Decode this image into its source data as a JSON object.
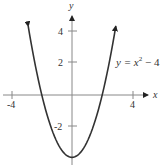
{
  "chart_data": {
    "type": "line",
    "title": "",
    "equation_label": "y = x² − 4",
    "equation_parts": {
      "lhs": "y = x",
      "exp": "2",
      "rhs": " − 4"
    },
    "xlabel": "x",
    "ylabel": "y",
    "xlim": [
      -4.5,
      5
    ],
    "ylim": [
      -4.3,
      5.3
    ],
    "x_ticks": [
      {
        "value": -4,
        "label": "-4"
      },
      {
        "value": 4,
        "label": "4"
      }
    ],
    "y_ticks": [
      {
        "value": 4,
        "label": "4"
      },
      {
        "value": 2,
        "label": "2"
      },
      {
        "value": -2,
        "label": "-2"
      }
    ],
    "grid": false,
    "series": [
      {
        "name": "y = x^2 - 4",
        "function": "x^2 - 4",
        "x": [
          -2.9,
          -2.5,
          -2,
          -1.5,
          -1,
          -0.5,
          0,
          0.5,
          1,
          1.5,
          2,
          2.5,
          2.9
        ],
        "y": [
          4.41,
          2.25,
          0,
          -1.75,
          -3,
          -3.75,
          -4,
          -3.75,
          -3,
          -1.75,
          0,
          2.25,
          4.41
        ]
      }
    ]
  }
}
